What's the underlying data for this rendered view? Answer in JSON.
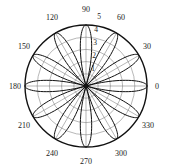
{
  "figure": {
    "kind": "polar-plot",
    "background_color": "#ffffff",
    "center_x": 86,
    "center_y": 86,
    "outer_radius": 61
  },
  "chart_data": {
    "type": "line",
    "subtype": "polar-rose",
    "title": "",
    "xlabel": "",
    "ylabel": "",
    "grid": true,
    "legend": null,
    "projection": "polar",
    "theta_unit": "degrees",
    "theta_direction": "counterclockwise",
    "theta_zero_location": "E",
    "rlim": [
      0,
      5
    ],
    "r_ticks": [
      1,
      2,
      3,
      4,
      5
    ],
    "r_tick_labels": [
      "1",
      "2",
      "3",
      "4",
      "5"
    ],
    "r_tick_label_angle_deg": 90,
    "theta_ticks": [
      0,
      30,
      60,
      90,
      120,
      150,
      180,
      210,
      240,
      270,
      300,
      330
    ],
    "theta_tick_labels": [
      "0",
      "30",
      "60",
      "90",
      "120",
      "150",
      "180",
      "210",
      "240",
      "270",
      "300",
      "330"
    ],
    "series": [
      {
        "name": "rose",
        "equation": "r = 5*|cos(6*theta)|",
        "petal_count": 12,
        "petal_amplitude": 5,
        "petal_angles_deg": [
          0,
          30,
          60,
          90,
          120,
          150,
          180,
          210,
          240,
          270,
          300,
          330
        ],
        "line_color": "#111111",
        "line_width": 1.0
      }
    ],
    "style": {
      "grid_color": "#6f6f6f",
      "grid_width": 0.5,
      "outer_circle_color": "#111111",
      "outer_circle_width": 1.4,
      "spoke_color": "#6f6f6f",
      "tick_label_color": "#1a1a1a"
    }
  },
  "labels": {
    "angular": [
      {
        "id": "theta-0",
        "text": "0",
        "x": 157,
        "y": 89,
        "anchor": "middle"
      },
      {
        "id": "theta-30",
        "text": "30",
        "x": 147,
        "y": 49,
        "anchor": "middle"
      },
      {
        "id": "theta-60",
        "text": "60",
        "x": 121,
        "y": 20,
        "anchor": "middle"
      },
      {
        "id": "theta-90",
        "text": "90",
        "x": 86,
        "y": 12,
        "anchor": "middle"
      },
      {
        "id": "theta-120",
        "text": "120",
        "x": 52,
        "y": 20,
        "anchor": "middle"
      },
      {
        "id": "theta-150",
        "text": "150",
        "x": 24,
        "y": 49,
        "anchor": "middle"
      },
      {
        "id": "theta-180",
        "text": "180",
        "x": 15,
        "y": 89,
        "anchor": "middle"
      },
      {
        "id": "theta-210",
        "text": "210",
        "x": 24,
        "y": 128,
        "anchor": "middle"
      },
      {
        "id": "theta-240",
        "text": "240",
        "x": 52,
        "y": 156,
        "anchor": "middle"
      },
      {
        "id": "theta-270",
        "text": "270",
        "x": 86,
        "y": 164,
        "anchor": "middle"
      },
      {
        "id": "theta-300",
        "text": "300",
        "x": 121,
        "y": 156,
        "anchor": "middle"
      },
      {
        "id": "theta-330",
        "text": "330",
        "x": 148,
        "y": 128,
        "anchor": "middle"
      }
    ],
    "radial": [
      {
        "id": "r-5",
        "text": "5",
        "x": 99,
        "y": 19
      },
      {
        "id": "r-4",
        "text": "4",
        "x": 96,
        "y": 32
      },
      {
        "id": "r-3",
        "text": "3",
        "x": 95,
        "y": 45
      },
      {
        "id": "r-2",
        "text": "2",
        "x": 94,
        "y": 58
      },
      {
        "id": "r-1",
        "text": "1",
        "x": 93,
        "y": 71
      }
    ]
  }
}
